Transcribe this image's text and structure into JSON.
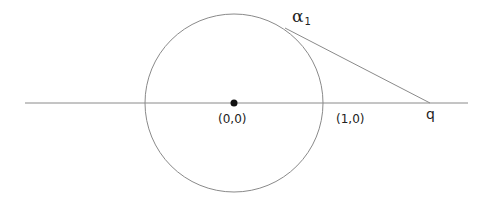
{
  "diagram": {
    "type": "geometry",
    "colors": {
      "line": "#8a8a8a",
      "circle": "#8a8a8a",
      "point": "#111111",
      "text": "#222222",
      "background": "#ffffff"
    },
    "axis": {
      "x1": 25,
      "y1": 103,
      "x2": 468,
      "y2": 103
    },
    "circle": {
      "cx": 234,
      "cy": 103,
      "r": 89
    },
    "center_point": {
      "cx": 234,
      "cy": 103,
      "r": 3.5
    },
    "tangent_line": {
      "x1": 285,
      "y1": 28,
      "x2": 430,
      "y2": 103
    },
    "labels": {
      "alpha": {
        "symbol": "α",
        "subscript": "1"
      },
      "origin": "(0,0)",
      "unit_point": "(1,0)",
      "q": "q"
    }
  }
}
